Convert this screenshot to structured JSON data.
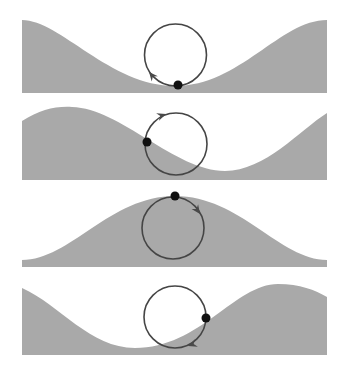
{
  "diagram": {
    "colors": {
      "background": "#ffffff",
      "wave_fill": "#a9a9a9",
      "orbit_stroke": "#454545",
      "particle": "#111111",
      "arrow": "#4a4a4a"
    },
    "panels": [
      {
        "id": "panel-1",
        "phase": "trough",
        "wave_path": "M22,20 C60,20 110,86 175,86 C240,86 280,20 327,20 L327,93 L22,93 Z",
        "orbit": {
          "cx": 175.5,
          "cy": 55,
          "r": 31
        },
        "particle": {
          "x": 178,
          "y": 85,
          "r": 4.5
        },
        "arrow": {
          "x": 149,
          "y": 72,
          "angle": -130
        }
      },
      {
        "id": "panel-2",
        "phase": "rising back slope",
        "wave_path": "M22,121 C40,110 55,106 72,107 C120,108 175,171 225,171 C265,171 300,130 327,113 L327,180 L22,180 Z",
        "orbit": {
          "cx": 176,
          "cy": 144,
          "r": 31
        },
        "particle": {
          "x": 147,
          "y": 142,
          "r": 4.5
        },
        "arrow": {
          "x": 166,
          "y": 114,
          "angle": -20
        }
      },
      {
        "id": "panel-3",
        "phase": "crest",
        "wave_path": "M22,260 C70,260 110,196 175,196 C240,196 280,260 327,260 L327,267 L22,267 Z",
        "orbit": {
          "cx": 173,
          "cy": 228,
          "r": 31
        },
        "particle": {
          "x": 175,
          "y": 196,
          "r": 4.5
        },
        "arrow": {
          "x": 200,
          "y": 214,
          "angle": 55
        }
      },
      {
        "id": "panel-4",
        "phase": "falling front slope",
        "wave_path": "M22,288 C60,305 90,348 135,348 C200,348 235,284 278,284 C300,284 315,290 327,297 L327,355 L22,355 Z",
        "orbit": {
          "cx": 175,
          "cy": 317,
          "r": 31
        },
        "particle": {
          "x": 206,
          "y": 318,
          "r": 4.5
        },
        "arrow": {
          "x": 188,
          "y": 346,
          "angle": 160
        }
      }
    ]
  }
}
